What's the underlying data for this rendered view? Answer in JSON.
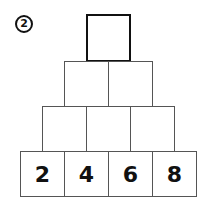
{
  "problem_number": "2",
  "pyramid": {
    "rows": [
      [
        ""
      ],
      [
        "",
        ""
      ],
      [
        "",
        "",
        ""
      ],
      [
        "2",
        "4",
        "6",
        "8"
      ]
    ]
  }
}
